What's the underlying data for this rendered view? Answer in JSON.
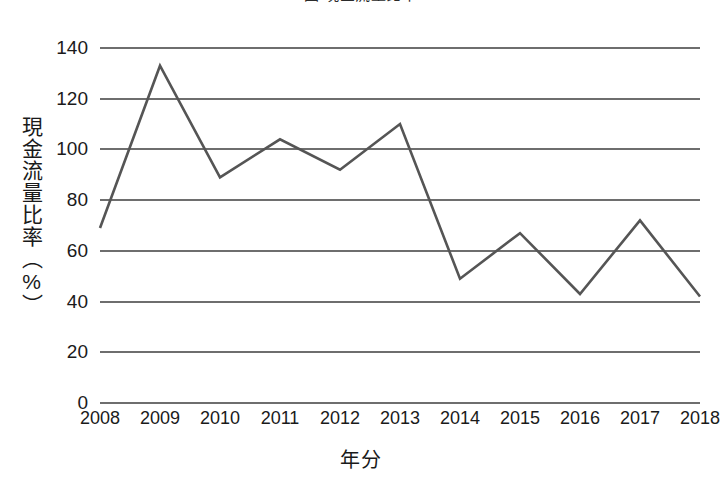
{
  "chart_data": {
    "type": "line",
    "title": "圖 現金流量比率",
    "xlabel": "年分",
    "ylabel": "現金流量比率（%）",
    "categories": [
      "2008",
      "2009",
      "2010",
      "2011",
      "2012",
      "2013",
      "2014",
      "2015",
      "2016",
      "2017",
      "2018"
    ],
    "values": [
      69,
      133,
      89,
      104,
      92,
      110,
      49,
      67,
      43,
      72,
      42
    ],
    "series": [
      {
        "name": "現金流量比率",
        "values": [
          69,
          133,
          89,
          104,
          92,
          110,
          49,
          67,
          43,
          72,
          42
        ]
      }
    ],
    "ylim": [
      0,
      140
    ],
    "y_ticks": [
      "0",
      "20",
      "40",
      "60",
      "80",
      "100",
      "120",
      "140"
    ],
    "y_tick_values": [
      0,
      20,
      40,
      60,
      80,
      100,
      120,
      140
    ],
    "grid": true,
    "legend": "none",
    "line_color": "#555555",
    "grid_color": "#6e6e6e",
    "background_color": "#ffffff",
    "markers": false
  },
  "axes": {
    "y_title": "現金流量比率（%）",
    "x_title": "年分"
  }
}
